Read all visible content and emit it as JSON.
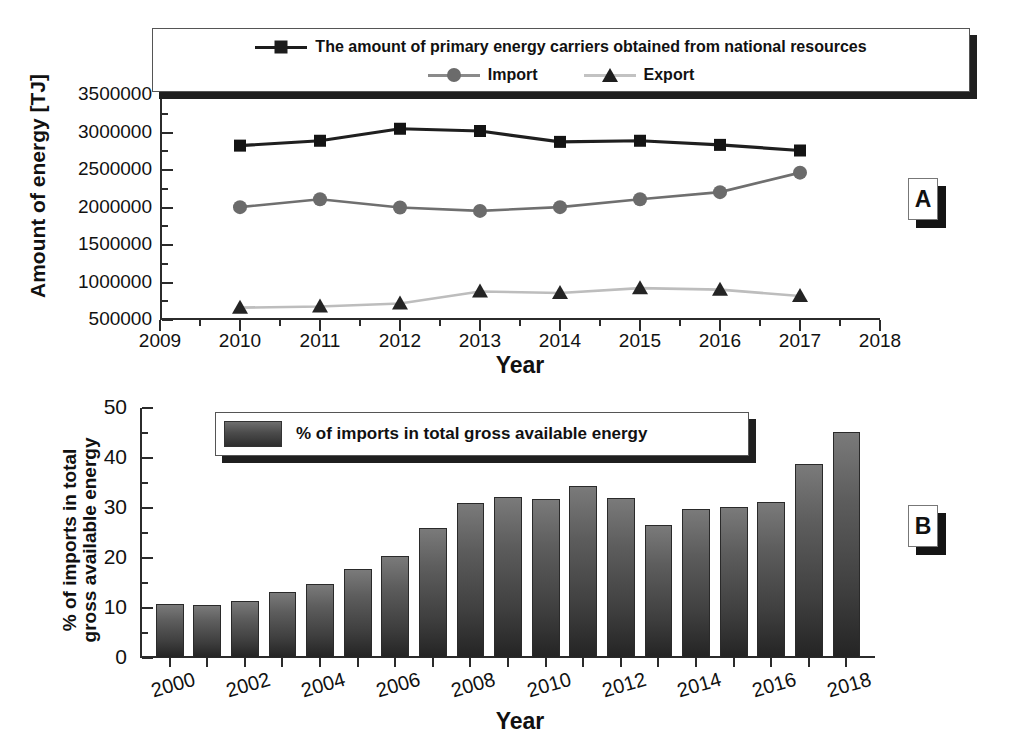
{
  "figure": {
    "panel_a_tag": "A",
    "panel_b_tag": "B"
  },
  "panel_a": {
    "xlabel": "Year",
    "ylabel": "Amount of energy [TJ]",
    "xticks": [
      "2009",
      "2010",
      "2011",
      "2012",
      "2013",
      "2014",
      "2015",
      "2016",
      "2017",
      "2018"
    ],
    "yticks": [
      "500000",
      "1000000",
      "1500000",
      "2000000",
      "2500000",
      "3000000",
      "3500000"
    ],
    "legend": [
      {
        "label": "The amount of primary energy carriers obtained from national resources",
        "marker": "square",
        "color": "#1c1c1c"
      },
      {
        "label": "Import",
        "marker": "circle",
        "color": "#6b6b6b"
      },
      {
        "label": "Export",
        "marker": "triangle",
        "color": "#b3b3b3"
      }
    ]
  },
  "panel_b": {
    "xlabel": "Year",
    "ylabel": "% of imports in total\ngross available energy",
    "xticks": [
      "2000",
      "2002",
      "2004",
      "2006",
      "2008",
      "2010",
      "2012",
      "2014",
      "2016",
      "2018"
    ],
    "yticks": [
      "0",
      "10",
      "20",
      "30",
      "40",
      "50"
    ],
    "legend": [
      {
        "label": "% of imports in total gross available energy",
        "marker": "swatch",
        "color": "#4b4b4b"
      }
    ]
  },
  "chart_data": [
    {
      "panel": "A",
      "type": "line",
      "title": "",
      "xlabel": "Year",
      "ylabel": "Amount of energy [TJ]",
      "xlim": [
        2009,
        2018
      ],
      "ylim": [
        500000,
        3500000
      ],
      "grid": false,
      "legend_position": "top",
      "x": [
        2010,
        2011,
        2012,
        2013,
        2014,
        2015,
        2016,
        2017
      ],
      "series": [
        {
          "name": "The amount of primary energy carriers obtained from national resources",
          "marker": "square",
          "color": "#1c1c1c",
          "values": [
            2825000,
            2890000,
            3050000,
            3020000,
            2875000,
            2890000,
            2835000,
            2760000
          ]
        },
        {
          "name": "Import",
          "marker": "circle",
          "color": "#6b6b6b",
          "values": [
            2005000,
            2110000,
            2000000,
            1955000,
            2005000,
            2110000,
            2205000,
            2465000
          ]
        },
        {
          "name": "Export",
          "marker": "triangle",
          "color": "#b3b3b3",
          "values": [
            665000,
            680000,
            720000,
            880000,
            860000,
            925000,
            905000,
            820000
          ]
        }
      ]
    },
    {
      "panel": "B",
      "type": "bar",
      "title": "",
      "xlabel": "Year",
      "ylabel": "% of imports in total gross available energy",
      "xlim": [
        1999,
        2019
      ],
      "ylim": [
        0,
        50
      ],
      "grid": false,
      "legend_position": "top-left",
      "categories": [
        "2000",
        "2001",
        "2002",
        "2003",
        "2004",
        "2005",
        "2006",
        "2007",
        "2008",
        "2009",
        "2010",
        "2011",
        "2012",
        "2013",
        "2014",
        "2015",
        "2016",
        "2017",
        "2018"
      ],
      "values": [
        10.9,
        10.6,
        11.5,
        13.3,
        14.8,
        17.9,
        20.4,
        26.0,
        31.1,
        32.3,
        31.9,
        34.4,
        32.1,
        26.7,
        29.8,
        30.3,
        31.3,
        38.8,
        45.3
      ],
      "series": [
        {
          "name": "% of imports in total gross available energy",
          "color": "#4b4b4b",
          "values": [
            10.9,
            10.6,
            11.5,
            13.3,
            14.8,
            17.9,
            20.4,
            26.0,
            31.1,
            32.3,
            31.9,
            34.4,
            32.1,
            26.7,
            29.8,
            30.3,
            31.3,
            38.8,
            45.3
          ]
        }
      ]
    }
  ]
}
